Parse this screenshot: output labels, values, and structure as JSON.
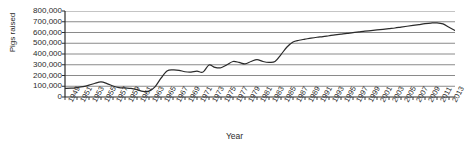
{
  "chart_data": {
    "type": "line",
    "title": "",
    "xlabel": "Year",
    "ylabel": "Pigs raised",
    "ylim": [
      0,
      800000
    ],
    "xlim": [
      1949,
      2014
    ],
    "grid": true,
    "legend": "none",
    "y_ticks": [
      "0",
      "100,000",
      "200,000",
      "300,000",
      "400,000",
      "500,000",
      "600,000",
      "700,000",
      "800,000"
    ],
    "y_tick_values": [
      0,
      100000,
      200000,
      300000,
      400000,
      500000,
      600000,
      700000,
      800000
    ],
    "x_ticks": [
      "1949",
      "1951",
      "1953",
      "1955",
      "1957",
      "1959",
      "1961",
      "1963",
      "1965",
      "1967",
      "1969",
      "1971",
      "1973",
      "1975",
      "1977",
      "1979",
      "1981",
      "1983",
      "1985",
      "1987",
      "1989",
      "1991",
      "1993",
      "1995",
      "1997",
      "1999",
      "2001",
      "2003",
      "2005",
      "2007",
      "2009",
      "2011",
      "2013"
    ],
    "series": [
      {
        "name": "Pigs raised",
        "color": "#2b2b2b",
        "x": [
          1949,
          1950,
          1951,
          1952,
          1953,
          1954,
          1955,
          1956,
          1957,
          1958,
          1959,
          1960,
          1961,
          1962,
          1963,
          1964,
          1965,
          1966,
          1967,
          1968,
          1969,
          1970,
          1971,
          1972,
          1973,
          1974,
          1975,
          1976,
          1977,
          1978,
          1979,
          1980,
          1981,
          1982,
          1983,
          1984,
          1985,
          1986,
          1987,
          1988,
          1989,
          1990,
          1991,
          1992,
          1993,
          1994,
          1995,
          1996,
          1997,
          1998,
          1999,
          2000,
          2001,
          2002,
          2003,
          2004,
          2005,
          2006,
          2007,
          2008,
          2009,
          2010,
          2011,
          2012,
          2013,
          2014
        ],
        "values": [
          80000,
          82000,
          88000,
          96000,
          110000,
          128000,
          140000,
          125000,
          102000,
          88000,
          84000,
          80000,
          68000,
          52000,
          55000,
          95000,
          175000,
          242000,
          252000,
          248000,
          235000,
          232000,
          240000,
          232000,
          298000,
          275000,
          272000,
          300000,
          330000,
          322000,
          308000,
          330000,
          348000,
          330000,
          322000,
          330000,
          395000,
          465000,
          512000,
          528000,
          538000,
          548000,
          556000,
          562000,
          570000,
          578000,
          585000,
          592000,
          598000,
          605000,
          612000,
          618000,
          624000,
          630000,
          636000,
          642000,
          650000,
          658000,
          666000,
          674000,
          682000,
          688000,
          690000,
          680000,
          648000,
          618000
        ]
      }
    ]
  },
  "axes": {
    "y_title": "Pigs raised",
    "x_title": "Year"
  }
}
